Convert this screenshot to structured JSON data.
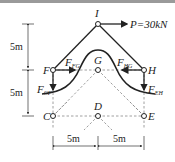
{
  "diagram": {
    "type": "truss free-body diagram",
    "load": {
      "label": "P=30kN",
      "node": "I",
      "direction": "right"
    },
    "nodes": [
      {
        "id": "I",
        "label": "I",
        "x": 98,
        "y": 24
      },
      {
        "id": "F",
        "label": "F",
        "x": 53,
        "y": 70
      },
      {
        "id": "G",
        "label": "G",
        "x": 98,
        "y": 70
      },
      {
        "id": "H",
        "label": "H",
        "x": 144,
        "y": 70
      },
      {
        "id": "C",
        "label": "C",
        "x": 53,
        "y": 116
      },
      {
        "id": "D",
        "label": "D",
        "x": 98,
        "y": 116
      },
      {
        "id": "E",
        "label": "E",
        "x": 144,
        "y": 116
      }
    ],
    "forces": [
      {
        "name": "F_FG",
        "main": "F",
        "sub": "FG"
      },
      {
        "name": "F_HG",
        "main": "F",
        "sub": "HG"
      },
      {
        "name": "F_CF",
        "main": "F",
        "sub": "CF"
      },
      {
        "name": "F_EH",
        "main": "F",
        "sub": "EH"
      }
    ],
    "dimensions": {
      "vertical_top": "5m",
      "vertical_bottom": "5m",
      "horizontal_left": "5m",
      "horizontal_right": "5m"
    }
  }
}
